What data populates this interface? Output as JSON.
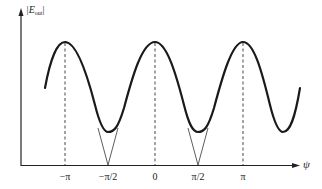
{
  "diagram": {
    "title": "",
    "y_axis": {
      "label_main": "|E",
      "label_sub": "out",
      "label_end": "|"
    },
    "x_axis": {
      "label": "ψ"
    },
    "ticks": [
      {
        "label": "−π",
        "x": 65
      },
      {
        "label": "−π/2",
        "x": 108
      },
      {
        "label": "0",
        "x": 155
      },
      {
        "label": "π/2",
        "x": 198
      },
      {
        "label": "π",
        "x": 243
      }
    ],
    "curve": {
      "description": "Sinusoidal |E_out| vs ψ with peaks at −π, 0, π and minima at ±π/2; thin V-shaped lines from curve to zero at ±π/2",
      "peak_positions": [
        "−π",
        "0",
        "π"
      ],
      "minimum_positions": [
        "−π/2",
        "π/2"
      ]
    },
    "colors": {
      "line": "#222222",
      "background": "#ffffff"
    }
  }
}
